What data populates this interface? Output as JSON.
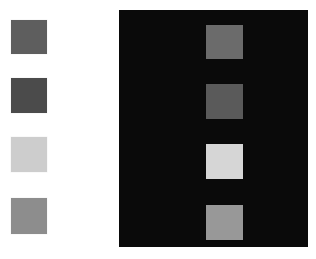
{
  "figure": {
    "canvas": {
      "width": 316,
      "height": 259
    },
    "background_color": "#ffffff"
  },
  "left_group": {
    "name": "patches-on-white",
    "background_color": "#ffffff",
    "patches": [
      {
        "label": "patch-1",
        "color": "#5e5e5e",
        "x": 11,
        "y": 20,
        "width": 36,
        "height": 34
      },
      {
        "label": "patch-2",
        "color": "#4b4b4b",
        "x": 11,
        "y": 78,
        "width": 36,
        "height": 35
      },
      {
        "label": "patch-3",
        "color": "#cdcdcd",
        "x": 11,
        "y": 137,
        "width": 36,
        "height": 35
      },
      {
        "label": "patch-4",
        "color": "#8d8d8d",
        "x": 11,
        "y": 198,
        "width": 36,
        "height": 36
      }
    ]
  },
  "right_group": {
    "name": "patches-on-black",
    "panel": {
      "label": "black-panel",
      "color": "#0a0a0a",
      "x": 119,
      "y": 10,
      "width": 189,
      "height": 237
    },
    "patches": [
      {
        "label": "patch-1",
        "color": "#6b6b6b",
        "x": 206,
        "y": 25,
        "width": 37,
        "height": 34
      },
      {
        "label": "patch-2",
        "color": "#5a5a5a",
        "x": 206,
        "y": 84,
        "width": 37,
        "height": 35
      },
      {
        "label": "patch-3",
        "color": "#d6d6d6",
        "x": 206,
        "y": 144,
        "width": 37,
        "height": 35
      },
      {
        "label": "patch-4",
        "color": "#989898",
        "x": 206,
        "y": 205,
        "width": 37,
        "height": 35
      }
    ]
  }
}
